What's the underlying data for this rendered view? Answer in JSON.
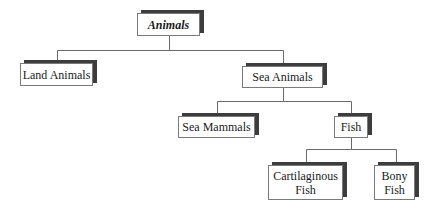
{
  "diagram": {
    "type": "hierarchy-tree",
    "root": {
      "label": "Animals",
      "children": [
        {
          "label": "Land Animals"
        },
        {
          "label": "Sea Animals",
          "children": [
            {
              "label": "Sea Mammals"
            },
            {
              "label": "Fish",
              "children": [
                {
                  "label": "Cartilaginous\nFish"
                },
                {
                  "label": "Bony\nFish"
                }
              ]
            }
          ]
        }
      ]
    }
  },
  "nodes": {
    "animals": "Animals",
    "land_animals": "Land Animals",
    "sea_animals": "Sea Animals",
    "sea_mammals": "Sea Mammals",
    "fish": "Fish",
    "cartilaginous_fish": "Cartilaginous\nFish",
    "bony_fish": "Bony\nFish"
  },
  "colors": {
    "shadow": "#3d3d3d",
    "border": "#7a7a7a",
    "line": "#6a6a6a",
    "text": "#1a1a1a",
    "background": "#ffffff"
  }
}
